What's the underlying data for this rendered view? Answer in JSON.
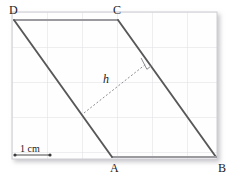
{
  "figure": {
    "shape_name": "parallelogram",
    "vertices": [
      {
        "name": "D",
        "label": "D",
        "x": 14,
        "y": 20,
        "label_x": 9,
        "label_y": 4
      },
      {
        "name": "C",
        "label": "C",
        "x": 118,
        "y": 20,
        "label_x": 113,
        "label_y": 4
      },
      {
        "name": "B",
        "label": "B",
        "x": 216,
        "y": 157,
        "label_x": 218,
        "label_y": 162
      },
      {
        "name": "A",
        "label": "A",
        "x": 112,
        "y": 157,
        "label_x": 110,
        "label_y": 162
      }
    ],
    "height": {
      "label": "h",
      "label_x": 103,
      "label_y": 73,
      "from_x": 84,
      "from_y": 113,
      "to_x": 146,
      "to_y": 64,
      "dash_pattern": "2,2",
      "right_angle_marker": true
    },
    "scale_bar": {
      "label": "1 cm",
      "label_x": 20,
      "label_y": 144,
      "start_x": 15,
      "end_x": 50,
      "y": 155,
      "endpoint_dot_radius": 1.6,
      "length_px": 35
    },
    "grid": {
      "left": 12,
      "top": 12,
      "right": 217,
      "bottom": 159,
      "cell_size_px": 35,
      "columns": 6,
      "rows": 4,
      "visible": true,
      "paper_color": "#fefefe",
      "line_color": "#d9d8dd",
      "border_color": "#cfced3"
    },
    "colors": {
      "shape_stroke": "#585858",
      "top_edge_stroke": "#8e8e93",
      "bottom_edge_stroke": "#8e8e93",
      "dashed_stroke": "#8d8d92",
      "label_color": "#1a1a1a",
      "background": "#ffffff",
      "shadow": "#c9c9cc"
    }
  }
}
